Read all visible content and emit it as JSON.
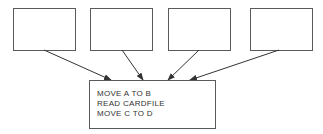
{
  "diagram": {
    "top_boxes": [
      {
        "id": "box-1",
        "x": 13,
        "y": 8,
        "w": 63,
        "h": 43
      },
      {
        "id": "box-2",
        "x": 90,
        "y": 8,
        "w": 63,
        "h": 43
      },
      {
        "id": "box-3",
        "x": 168,
        "y": 8,
        "w": 63,
        "h": 43
      },
      {
        "id": "box-4",
        "x": 250,
        "y": 8,
        "w": 63,
        "h": 43
      }
    ],
    "code_box": {
      "lines": [
        "MOVE A TO B",
        "READ CARDFILE",
        "MOVE C TO D"
      ]
    },
    "arrows": [
      {
        "from": "box-1",
        "to": "code_box"
      },
      {
        "from": "box-2",
        "to": "code_box"
      },
      {
        "from": "box-3",
        "to": "code_box"
      },
      {
        "from": "box-4",
        "to": "code_box"
      }
    ],
    "colors": {
      "stroke": "#333333",
      "border": "#5a5a5a",
      "text": "#333333"
    }
  }
}
